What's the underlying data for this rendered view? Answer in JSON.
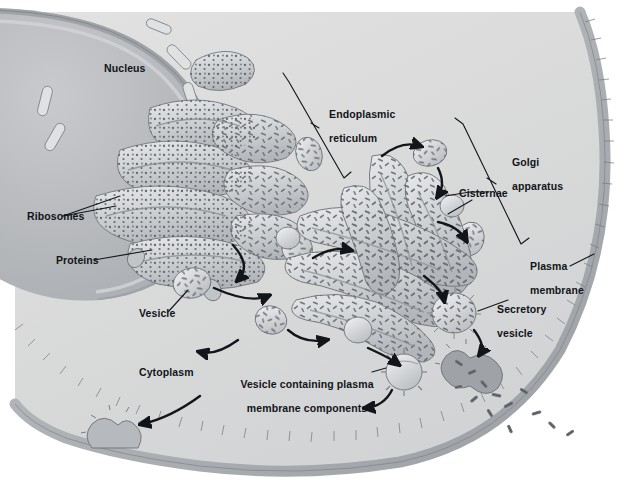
{
  "figure": {
    "type": "biology-diagram",
    "palette": {
      "cytoplasm": "#dcdcdc",
      "nucleus": "#b9bcc0",
      "organelle_fill": "#c9cccf",
      "organelle_light": "#e4e6e8",
      "membrane_band": "#b4b7bb",
      "membrane_shadow": "#9a9da1",
      "outline": "#6e7276",
      "text": "#111418",
      "background": "#ffffff"
    }
  },
  "labels": {
    "nucleus": "Nucleus",
    "ribosomes": "Ribosomes",
    "proteins": "Proteins",
    "vesicle": "Vesicle",
    "cytoplasm": "Cytoplasm",
    "endoplasmic_reticulum_line1": "Endoplasmic",
    "endoplasmic_reticulum_line2": "reticulum",
    "golgi_line1": "Golgi",
    "golgi_line2": "apparatus",
    "cisternae": "Cisternae",
    "plasma_membrane_line1": "Plasma",
    "plasma_membrane_line2": "membrane",
    "secretory_vesicle_line1": "Secretory",
    "secretory_vesicle_line2": "vesicle",
    "vesicle_plasma_line1": "Vesicle containing plasma",
    "vesicle_plasma_line2": "membrane components"
  }
}
